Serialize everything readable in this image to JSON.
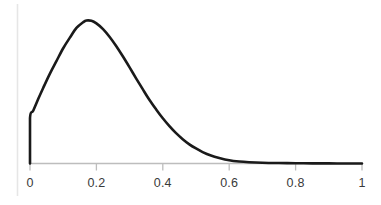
{
  "figure": {
    "background_color": "#ffffff",
    "width": 381,
    "height": 205
  },
  "axis": {
    "line_color": "#bdbdbd",
    "tick_color": "#bdbdbd",
    "left_rule_color": "#e6e6e6",
    "label_color": "#3a3a3a"
  },
  "curve": {
    "color": "#1a1a1a",
    "width": 2.6
  },
  "chart_data": {
    "type": "line",
    "title": "",
    "subtitle": "",
    "xlabel": "",
    "ylabel": "",
    "xlim": [
      0,
      1
    ],
    "ylim": [
      0,
      1
    ],
    "grid": false,
    "legend": null,
    "xticks": [
      0,
      0.2,
      0.4,
      0.6,
      0.8,
      1
    ],
    "xticklabels": [
      "0",
      "0.2",
      "0.4",
      "0.6",
      "0.8",
      "1"
    ],
    "yticks": [],
    "yticklabels": [],
    "annotations": [],
    "series": [
      {
        "name": "density",
        "description": "Right-skewed unimodal density rising from a nonzero value at x=0, peaking near x=0.17, decaying to ~0 by x=0.65 and flat thereafter.",
        "x": [
          0.0,
          0.0,
          0.01,
          0.025,
          0.04,
          0.06,
          0.08,
          0.1,
          0.12,
          0.14,
          0.16,
          0.17,
          0.185,
          0.2,
          0.22,
          0.24,
          0.26,
          0.28,
          0.3,
          0.32,
          0.34,
          0.36,
          0.38,
          0.4,
          0.42,
          0.44,
          0.46,
          0.48,
          0.5,
          0.52,
          0.545,
          0.57,
          0.6,
          0.63,
          0.66,
          0.7,
          0.75,
          0.8,
          0.85,
          0.9,
          0.95,
          1.0
        ],
        "y": [
          0.0,
          0.318,
          0.37,
          0.452,
          0.53,
          0.629,
          0.718,
          0.806,
          0.88,
          0.948,
          0.988,
          1.0,
          0.998,
          0.98,
          0.94,
          0.885,
          0.82,
          0.748,
          0.672,
          0.594,
          0.518,
          0.444,
          0.378,
          0.316,
          0.261,
          0.212,
          0.17,
          0.134,
          0.105,
          0.08,
          0.056,
          0.039,
          0.023,
          0.014,
          0.009,
          0.005,
          0.003,
          0.002,
          0.001,
          0.001,
          0.0,
          0.0
        ]
      }
    ]
  },
  "xticklabels": {
    "t0": "0",
    "t1": "0.2",
    "t2": "0.4",
    "t3": "0.6",
    "t4": "0.8",
    "t5": "1"
  }
}
